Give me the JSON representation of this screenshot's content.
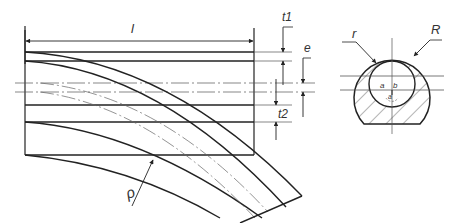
{
  "figure": {
    "type": "technical-drawing",
    "colors": {
      "line": "#222222",
      "thin_line": "#555555",
      "background": "#ffffff"
    }
  },
  "labels": {
    "length": "l",
    "t1": "t1",
    "t2": "t2",
    "e": "e",
    "rho": "ρ",
    "inner_radius": "r",
    "outer_radius": "R",
    "a": "a",
    "b": "b",
    "section_a": "a"
  }
}
